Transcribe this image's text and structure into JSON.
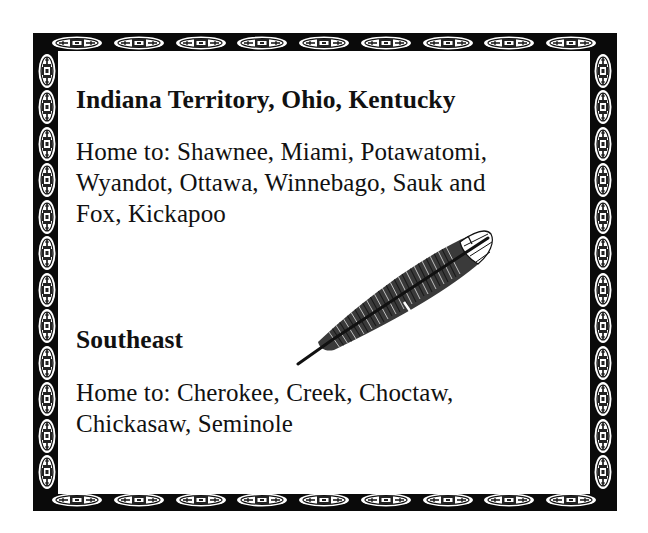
{
  "card": {
    "colors": {
      "border": "#0a0a0a",
      "background": "#ffffff",
      "text": "#111111"
    },
    "border_pattern": {
      "top_medallions": 9,
      "bottom_medallions": 9,
      "left_medallions": 12,
      "right_medallions": 12,
      "icon": "tribal-medallion-icon"
    },
    "sections": [
      {
        "heading": "Indiana Territory, Ohio, Kentucky",
        "body_lines": [
          "Home to:  Shawnee, Miami, Potawatomi,",
          "Wyandot, Ottawa, Winnebago, Sauk and",
          "Fox, Kickapoo"
        ]
      },
      {
        "heading": "Southeast",
        "body_lines": [
          "Home to:  Cherokee, Creek, Choctaw,",
          "Chickasaw, Seminole"
        ]
      }
    ],
    "illustration": "feather-icon"
  }
}
